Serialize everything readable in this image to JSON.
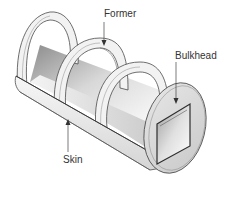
{
  "diagram": {
    "labels": {
      "former": "Former",
      "bulkhead": "Bulkhead",
      "skin": "Skin"
    },
    "colors": {
      "outline": "#4a4a4a",
      "ring_fill": "#f2f2f2",
      "interior_dark": "#9a9a9a",
      "interior_light": "#ededed",
      "bulkhead_fill": "#dcdcdc",
      "label_text": "#333333"
    }
  }
}
